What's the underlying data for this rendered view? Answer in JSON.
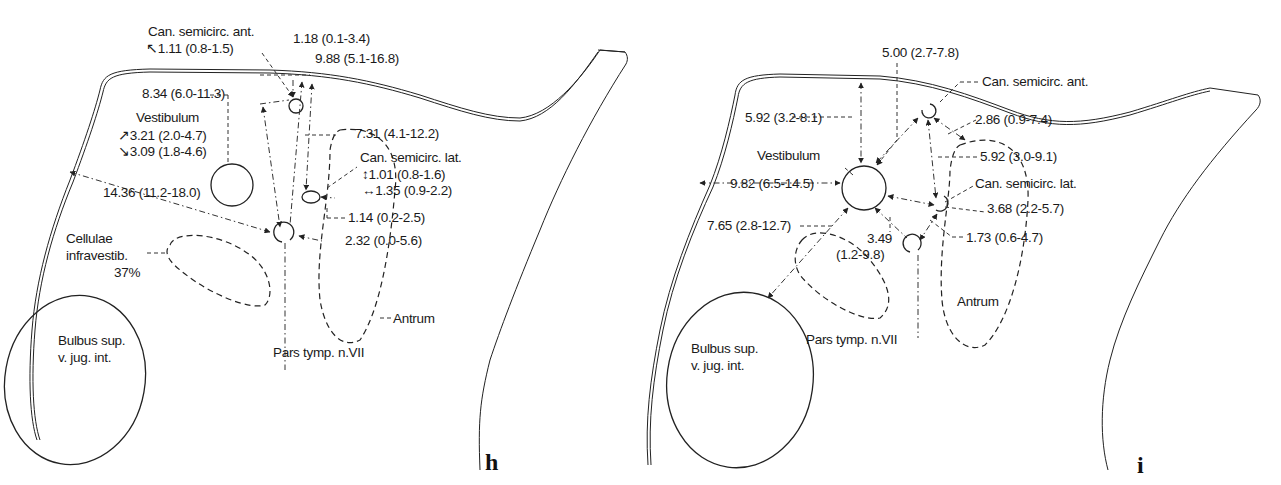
{
  "panels": {
    "h": {
      "letter": "h",
      "labels": {
        "can_semicirc_ant": "Can. semicirc. ant.",
        "can_semicirc_ant_size": "1.11 (0.8-1.5)",
        "dist_top_1": "1.18 (0.1-3.4)",
        "dist_top_2": "9.88  (5.1-16.8)",
        "dist_ant_vest": "8.34  (6.0-11.3)",
        "vestibulum": "Vestibulum",
        "vest_size_1": "3.21 (2.0-4.7)",
        "vest_size_2": "3.09 (1.8-4.6)",
        "dist_lat_top": "7.31  (4.1-12.2)",
        "can_semicirc_lat": "Can. semicirc. lat.",
        "lat_size_1": "1.01 (0.8-1.6)",
        "lat_size_2": "1.35 (0.9-2.2)",
        "dist_wall": "14.36 (11.2-18.0)",
        "dist_lat_antrum": "1.14 (0.2-2.5)",
        "dist_fn_antrum": "2.32 (0.0-5.6)",
        "cellulae_1": "Cellulae",
        "cellulae_2": "infravestib.",
        "cellulae_pct": "37%",
        "antrum": "Antrum",
        "pars_tymp": "Pars tymp. n.VII",
        "bulbus_1": "Bulbus sup.",
        "bulbus_2": "v. jug. int."
      }
    },
    "i": {
      "letter": "i",
      "labels": {
        "dist_vest_top": "5.00 (2.7-7.8)",
        "can_semicirc_ant": "Can. semicirc. ant.",
        "dist_ant_antrum": "2.86 (0.9-7.4)",
        "dist_wall_top": "5.92 (3.2-8.1)",
        "dist_ant_lat": "5.92 (3.0-9.1)",
        "vestibulum": "Vestibulum",
        "can_semicirc_lat": "Can. semicirc. lat.",
        "dist_wall": "9.82 (6.5-14.5)",
        "dist_lat_vest": "3.68 (2.2-5.7)",
        "dist_bulbus": "7.65 (2.8-12.7)",
        "dist_fn_1": "3.49",
        "dist_fn_2": "(1.2-9.8)",
        "dist_lat_fn": "1.73 (0.6-4.7)",
        "antrum": "Antrum",
        "pars_tymp": "Pars tymp. n.VII",
        "bulbus_1": "Bulbus sup.",
        "bulbus_2": "v. jug. int."
      }
    }
  }
}
